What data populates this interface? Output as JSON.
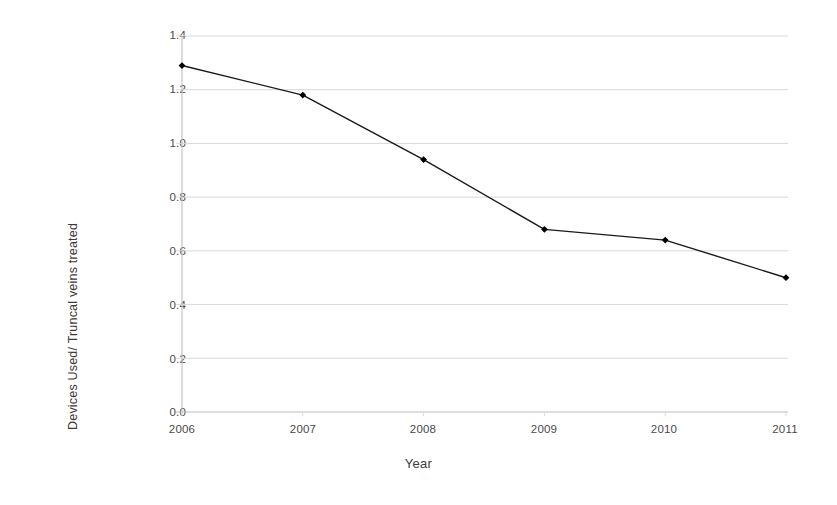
{
  "chart_data": {
    "type": "line",
    "title": "",
    "xlabel": "Year",
    "ylabel": "Devices Used/ Truncal veins treated",
    "categories": [
      "2006",
      "2007",
      "2008",
      "2009",
      "2010",
      "2011"
    ],
    "x": [
      2006,
      2007,
      2008,
      2009,
      2010,
      2011
    ],
    "values": [
      1.29,
      1.18,
      0.94,
      0.68,
      0.64,
      0.5
    ],
    "series": [
      {
        "name": "Devices Used/ Truncal veins treated",
        "values": [
          1.29,
          1.18,
          0.94,
          0.68,
          0.64,
          0.5
        ]
      }
    ],
    "ylim": [
      0.0,
      1.4
    ],
    "xlim": [
      2006,
      2011
    ],
    "yticks": [
      0.0,
      0.2,
      0.4,
      0.6,
      0.8,
      1.0,
      1.2,
      1.4
    ],
    "ytick_labels": [
      "0.0",
      "0.2",
      "0.4",
      "0.6",
      "0.8",
      "1.0",
      "1.2",
      "1.4"
    ],
    "xticks": [
      2006,
      2007,
      2008,
      2009,
      2010,
      2011
    ],
    "xtick_labels": [
      "2006",
      "2007",
      "2008",
      "2009",
      "2010",
      "2011"
    ],
    "grid": "horizontal",
    "legend": "none",
    "marker": "diamond",
    "line_color": "#1a1a1a",
    "marker_color": "#000000",
    "grid_color": "#d9d9d9",
    "axis_color": "#bfbfbf",
    "background_color": "#ffffff"
  },
  "axes": {
    "y_title": "Devices Used/ Truncal veins treated",
    "x_title": "Year"
  },
  "ticks": {
    "y": [
      "1.4",
      "1.2",
      "1.0",
      "0.8",
      "0.6",
      "0.4",
      "0.2",
      "0.0"
    ],
    "x": [
      "2006",
      "2007",
      "2008",
      "2009",
      "2010",
      "2011"
    ]
  }
}
